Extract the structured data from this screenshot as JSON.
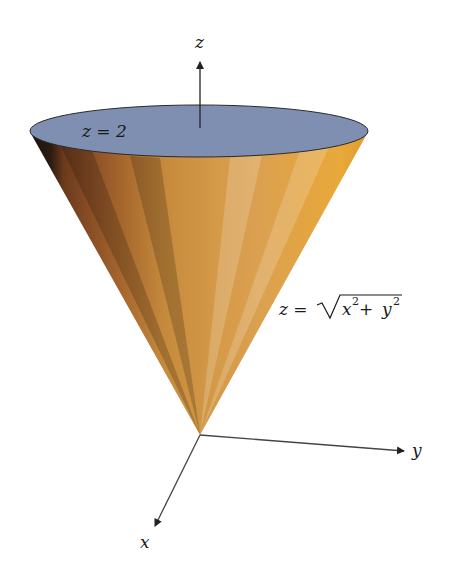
{
  "figure": {
    "type": "3d-surface-diagram",
    "surface": "cone",
    "cap": "plane disk"
  },
  "axes": {
    "z_label": "z",
    "y_label": "y",
    "x_label": "x"
  },
  "labels": {
    "plane_label": "z = 2",
    "surface_eq_lhs": "z = ",
    "surface_eq_rad_x": "x",
    "surface_eq_sup1": "2",
    "surface_eq_plus": " + ",
    "surface_eq_rad_y": "y",
    "surface_eq_sup2": "2"
  },
  "colors": {
    "cap": "#7d8fb3",
    "cone_light": "#e3a23c",
    "cone_mid": "#c98a36",
    "cone_dark": "#2a1a10",
    "axis": "#222222"
  }
}
